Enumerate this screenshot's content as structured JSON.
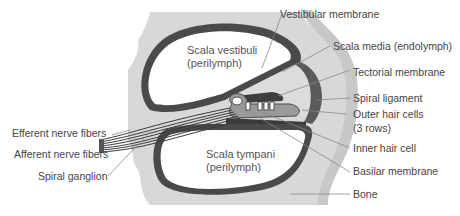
{
  "diagram": {
    "colors": {
      "bone": "#d6d6d6",
      "wall": "#4a4a4a",
      "chamber": "#ffffff",
      "media": "#dcdcdc",
      "ligament": "#6a6a6a",
      "leader": "#888888",
      "text": "#444444"
    },
    "inner_labels": {
      "scala_vestibuli": [
        "Scala vestibuli",
        "(perilymph)"
      ],
      "scala_tympani": [
        "Scala tympani",
        "(perilymph)"
      ]
    },
    "right_labels": [
      {
        "id": "vestibular-membrane",
        "text": "Vestibular membrane"
      },
      {
        "id": "scala-media",
        "text": "Scala media (endolymph)"
      },
      {
        "id": "tectorial-membrane",
        "text": "Tectorial membrane"
      },
      {
        "id": "spiral-ligament",
        "text": "Spiral ligament"
      },
      {
        "id": "outer-hair-cells",
        "text": "Outer hair cells",
        "text2": "(3 rows)"
      },
      {
        "id": "inner-hair-cell",
        "text": "Inner hair cell"
      },
      {
        "id": "basilar-membrane",
        "text": "Basilar membrane"
      },
      {
        "id": "bone",
        "text": "Bone"
      }
    ],
    "left_labels": [
      {
        "id": "efferent-nerve-fibers",
        "text": "Efferent nerve fibers"
      },
      {
        "id": "afferent-nerve-fibers",
        "text": "Afferent nerve fibers"
      },
      {
        "id": "spiral-ganglion",
        "text": "Spiral ganglion"
      }
    ]
  }
}
